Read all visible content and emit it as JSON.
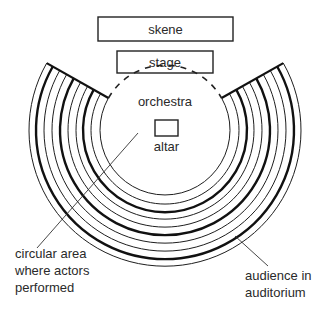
{
  "diagram": {
    "labels": {
      "skene": "skene",
      "stage": "stage",
      "orchestra": "orchestra",
      "altar": "altar",
      "circular_area_line1": "circular area",
      "circular_area_line2": "where actors",
      "circular_area_line3": "performed",
      "audience_line1": "audience in",
      "audience_line2": "auditorium"
    },
    "geometry": {
      "center": [
        165,
        130
      ],
      "ring_radii": [
        65,
        74,
        82,
        89,
        97,
        105,
        113,
        121,
        129,
        136
      ],
      "thick_rings": [
        82,
        105,
        129
      ],
      "opening_angle_deg": 29.5
    },
    "colors": {
      "line": "#111111",
      "text": "#2a2a2a",
      "background": "#ffffff"
    }
  }
}
